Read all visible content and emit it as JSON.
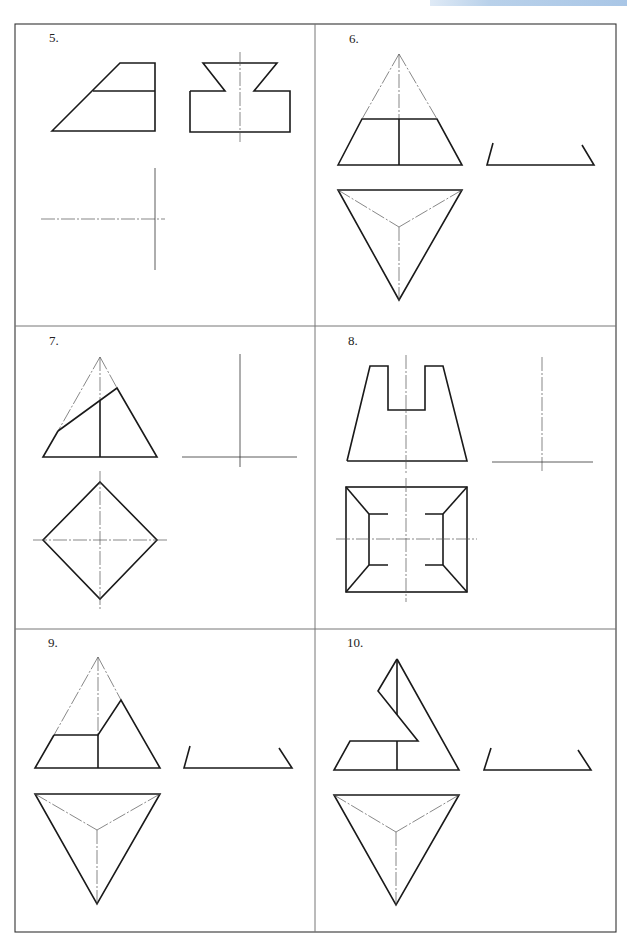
{
  "page": {
    "header_band_color": "#b9d1ea",
    "line_color": "#1a1a1a"
  },
  "problems": [
    {
      "number": "5.",
      "views": [
        "front-view",
        "side-view",
        "top-view-axes-only"
      ]
    },
    {
      "number": "6.",
      "views": [
        "front-view",
        "side-view-partial",
        "top-view"
      ]
    },
    {
      "number": "7.",
      "views": [
        "front-view",
        "side-view-axes-only",
        "top-view"
      ]
    },
    {
      "number": "8.",
      "views": [
        "front-view",
        "side-view-axes-only",
        "top-view"
      ]
    },
    {
      "number": "9.",
      "views": [
        "front-view",
        "side-view-partial",
        "top-view"
      ]
    },
    {
      "number": "10.",
      "views": [
        "front-view",
        "side-view-partial",
        "top-view"
      ]
    }
  ]
}
